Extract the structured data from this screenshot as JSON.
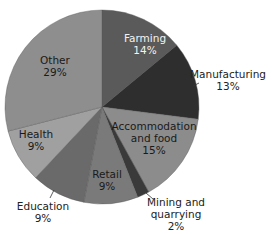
{
  "chart_data": {
    "type": "pie",
    "title": "",
    "start_angle": "12 o'clock",
    "direction": "clockwise",
    "categories": [
      "Farming",
      "Manufacturing",
      "Accommodation and food",
      "Mining and quarrying",
      "Retail",
      "Education",
      "Health",
      "Other"
    ],
    "values": [
      14,
      13,
      15,
      2,
      9,
      9,
      9,
      29
    ],
    "unit": "%",
    "colors": [
      "#5a5a5a",
      "#2e2e2e",
      "#8c8c8c",
      "#3a3a3a",
      "#7a7a7a",
      "#6a6a6a",
      "#a0a0a0",
      "#8e8e8e"
    ],
    "labels": [
      {
        "name": "Farming",
        "pct": "14%"
      },
      {
        "name": "Manufacturing",
        "pct": "13%"
      },
      {
        "name": "Accommodation and food",
        "line1": "Accommodation",
        "line2": "and food",
        "pct": "15%"
      },
      {
        "name": "Mining and quarrying",
        "line1": "Mining and",
        "line2": "quarrying",
        "pct": "2%"
      },
      {
        "name": "Retail",
        "pct": "9%"
      },
      {
        "name": "Education",
        "pct": "9%"
      },
      {
        "name": "Health",
        "pct": "9%"
      },
      {
        "name": "Other",
        "pct": "29%"
      }
    ]
  }
}
